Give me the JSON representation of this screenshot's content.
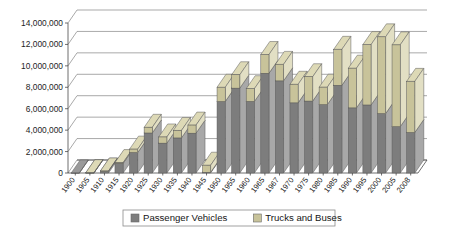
{
  "chart_data": {
    "type": "bar",
    "subtype": "stacked-column-3d",
    "title": "",
    "xlabel": "",
    "ylabel": "",
    "ylim": [
      0,
      14000000
    ],
    "ytick_labels": [
      "0",
      "2,000,000",
      "4,000,000",
      "6,000,000",
      "8,000,000",
      "10,000,000",
      "12,000,000",
      "14,000,000"
    ],
    "ytick_values": [
      0,
      2000000,
      4000000,
      6000000,
      8000000,
      10000000,
      12000000,
      14000000
    ],
    "ytick_step": 2000000,
    "grid": true,
    "grid_axis": "y",
    "legend_position": "bottom",
    "categories": [
      "1900",
      "1905",
      "1910",
      "1915",
      "1920",
      "1925",
      "1930",
      "1935",
      "1940",
      "1945",
      "1950",
      "1955",
      "1960",
      "1965",
      "1967",
      "1970",
      "1975",
      "1980",
      "1985",
      "1990",
      "1995",
      "2000",
      "2005",
      "2008"
    ],
    "series": [
      {
        "name": "Passenger Vehicles",
        "color": "#7d7d7d",
        "values": [
          4000,
          24000,
          181000,
          896000,
          1906000,
          3735000,
          2787000,
          3273000,
          3717000,
          70000,
          6666000,
          7920000,
          6675000,
          9306000,
          8598000,
          6547000,
          6713000,
          6376000,
          8185000,
          6078000,
          6350000,
          5542000,
          4321000,
          3777000
        ]
      },
      {
        "name": "Trucks and Buses",
        "color": "#c8c39a",
        "values": [
          0,
          1000,
          10000,
          74000,
          322000,
          530000,
          575000,
          697000,
          754000,
          656000,
          1337000,
          1249000,
          1194000,
          1752000,
          1539000,
          1733000,
          2272000,
          1634000,
          3357000,
          3702000,
          5635000,
          7167000,
          7636000,
          4776000
        ]
      }
    ],
    "totals": [
      4000,
      25000,
      191000,
      970000,
      2228000,
      4265000,
      3362000,
      3970000,
      4471000,
      726000,
      8003000,
      9169000,
      7869000,
      11058000,
      10137000,
      8280000,
      8985000,
      8010000,
      11542000,
      9780000,
      11985000,
      12709000,
      11957000,
      8553000
    ],
    "legend": [
      {
        "label": "Passenger Vehicles",
        "color": "#7d7d7d"
      },
      {
        "label": "Trucks and Buses",
        "color": "#c8c39a"
      }
    ]
  },
  "colors": {
    "passenger_front": "#7d7d7d",
    "passenger_side": "#a8a8a8",
    "passenger_top": "#9a9a9a",
    "truck_front": "#c8c39a",
    "truck_side": "#e2dfc4",
    "truck_top": "#ddd9b6",
    "grid": "#6e6e6e",
    "axis": "#4a4a4a",
    "background": "#ffffff",
    "legend_border": "#8a8a8a"
  }
}
